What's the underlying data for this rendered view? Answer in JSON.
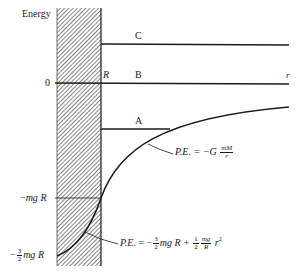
{
  "diagram": {
    "y_axis_label": "Energy",
    "zero_label": "0",
    "radius_label": "R",
    "r_axis_label": "r",
    "levels": [
      {
        "name": "C",
        "label": "C"
      },
      {
        "name": "B",
        "label": "B"
      },
      {
        "name": "A",
        "label": "A"
      }
    ],
    "tick_labels": {
      "neg_mgR": {
        "sign": "−",
        "text": "mg",
        "R": "R"
      },
      "neg_three_halves_mgR": {
        "sign": "−",
        "num": "3",
        "den": "2",
        "text": "mg",
        "R": "R"
      }
    },
    "outside_formula": {
      "lhs": "P.E.",
      "eq": "= −G",
      "num": "mM",
      "den": "r"
    },
    "inside_formula": {
      "lhs": "P.E.",
      "eq": "= −",
      "f1_num": "3",
      "f1_den": "2",
      "t1": "mg R +",
      "f2_num": "1",
      "f2_den": "2",
      "f3_num": "mg",
      "f3_den": "R",
      "t2": "r",
      "exp": "2"
    },
    "colors": {
      "ink": "#1a1a1a",
      "background": "#ffffff",
      "hatch": "#555555"
    }
  }
}
